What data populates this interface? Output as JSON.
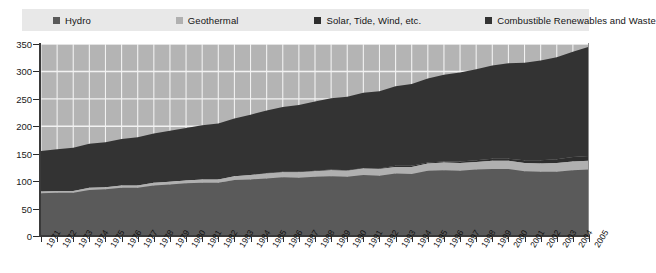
{
  "title_ghost": "",
  "legend": {
    "items": [
      {
        "label": "Hydro",
        "color": "#5a5a5a",
        "key": "hydro"
      },
      {
        "label": "Geothermal",
        "color": "#b0b0b0",
        "key": "geothermal"
      },
      {
        "label": "Solar, Tide, Wind, etc.",
        "color": "#2e2e2e",
        "key": "solar_tide_wind"
      },
      {
        "label": "Combustible Renewables and Waste",
        "color": "#333333",
        "key": "combustible"
      }
    ]
  },
  "axes": {
    "y_ticks": [
      "0",
      "50",
      "100",
      "150",
      "200",
      "250",
      "300",
      "350"
    ],
    "y_min": 0,
    "y_max": 350,
    "y_step": 50,
    "x_first": "1971",
    "x_last": "2005"
  },
  "colors": {
    "plot_background": "#b4b4b4",
    "gridline": "#f2f2f2",
    "legend_background": "#e8e8e8",
    "axis": "#3a3a3a",
    "page_background": "#ffffff"
  },
  "chart_data": {
    "type": "area",
    "stacked": true,
    "title": "",
    "xlabel": "",
    "ylabel": "",
    "ylim": [
      0,
      350
    ],
    "grid": true,
    "legend_position": "top",
    "x": [
      "1971",
      "1972",
      "1973",
      "1974",
      "1975",
      "1976",
      "1977",
      "1978",
      "1979",
      "1980",
      "1981",
      "1982",
      "1983",
      "1984",
      "1985",
      "1986",
      "1987",
      "1988",
      "1989",
      "1990",
      "1991",
      "1992",
      "1993",
      "1994",
      "1995",
      "1996",
      "1997",
      "1998",
      "1999",
      "2000",
      "2001",
      "2002",
      "2003",
      "2004",
      "2005"
    ],
    "series": [
      {
        "name": "Hydro",
        "color": "#5a5a5a",
        "values": [
          78,
          79,
          79,
          84,
          85,
          88,
          88,
          92,
          94,
          96,
          97,
          97,
          102,
          103,
          105,
          107,
          106,
          108,
          109,
          108,
          111,
          110,
          114,
          113,
          119,
          120,
          119,
          121,
          122,
          122,
          118,
          117,
          117,
          120,
          121
        ]
      },
      {
        "name": "Geothermal",
        "color": "#b0b0b0",
        "values": [
          3,
          3,
          3,
          4,
          4,
          4,
          4,
          5,
          5,
          5,
          6,
          6,
          7,
          8,
          9,
          9,
          10,
          10,
          11,
          11,
          12,
          12,
          12,
          13,
          13,
          14,
          14,
          14,
          15,
          15,
          15,
          15,
          16,
          16,
          16
        ]
      },
      {
        "name": "Solar, Tide, Wind, etc.",
        "color": "#2e2e2e",
        "values": [
          0,
          0,
          0,
          0,
          0,
          0,
          0,
          0,
          0,
          0,
          0,
          0,
          0,
          0,
          1,
          1,
          1,
          1,
          1,
          1,
          1,
          1,
          2,
          2,
          2,
          2,
          3,
          3,
          4,
          4,
          5,
          6,
          7,
          8,
          9
        ]
      },
      {
        "name": "Combustible Renewables and Waste",
        "color": "#333333",
        "values": [
          74,
          76,
          79,
          80,
          82,
          85,
          88,
          90,
          93,
          96,
          99,
          102,
          105,
          110,
          114,
          118,
          122,
          126,
          130,
          134,
          137,
          141,
          145,
          149,
          153,
          158,
          162,
          166,
          170,
          174,
          178,
          182,
          186,
          192,
          199
        ]
      }
    ],
    "totals": [
      155,
      158,
      161,
      168,
      171,
      177,
      180,
      187,
      192,
      197,
      202,
      205,
      214,
      221,
      229,
      235,
      239,
      245,
      251,
      254,
      261,
      264,
      273,
      277,
      287,
      294,
      298,
      304,
      311,
      315,
      316,
      320,
      326,
      336,
      345
    ]
  }
}
